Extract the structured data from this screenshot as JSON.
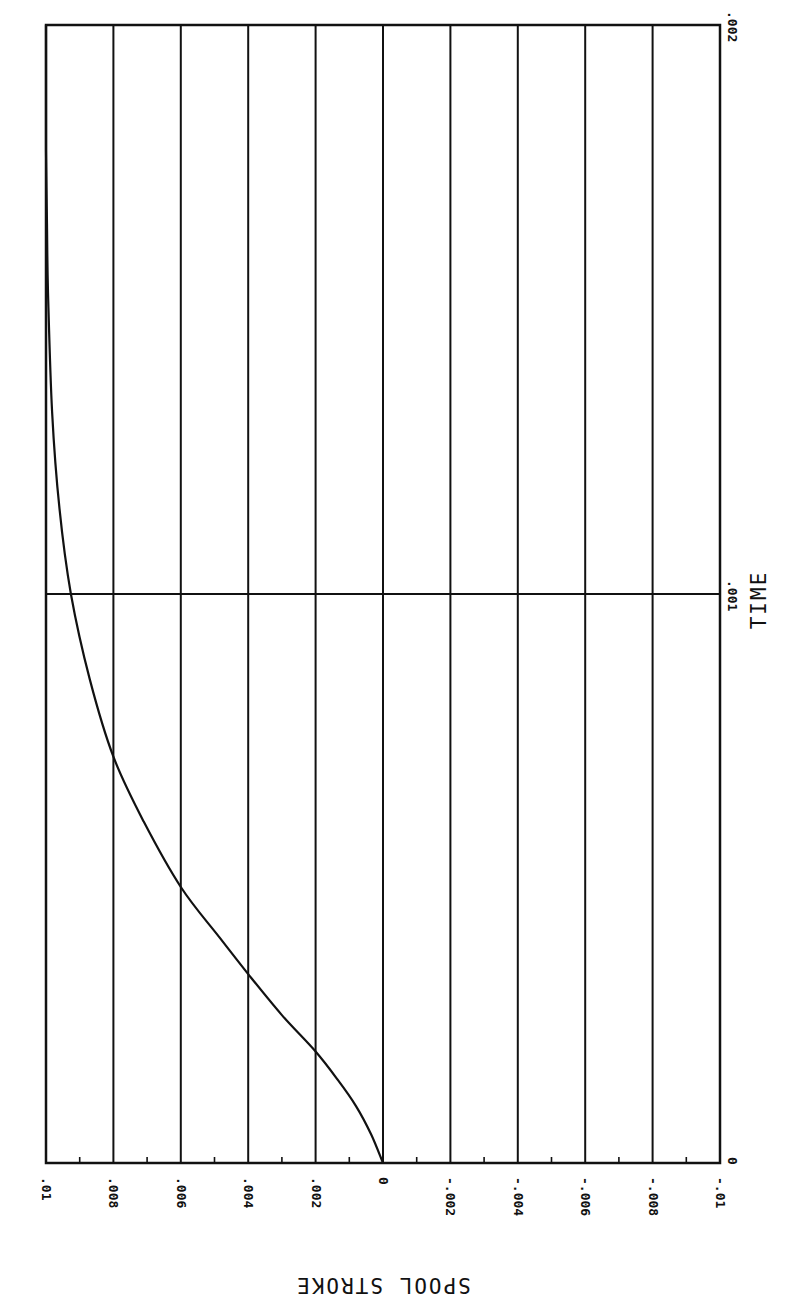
{
  "chart_data": {
    "type": "line",
    "title": "",
    "orientation": "rotated-90 (time runs bottom-to-top, stroke runs right-to-left)",
    "xlabel": "TIME",
    "ylabel": "SPOOL STROKE",
    "xlim": [
      0,
      0.002
    ],
    "ylim": [
      -0.01,
      0.01
    ],
    "x_ticks": [
      "0",
      ".001",
      ".002"
    ],
    "y_ticks": [
      ".01",
      ".008",
      ".006",
      ".004",
      ".002",
      "0",
      "-.002",
      "-.004",
      "-.006",
      "-.008",
      "-.01"
    ],
    "y_tick_values": [
      0.01,
      0.008,
      0.006,
      0.004,
      0.002,
      0,
      -0.002,
      -0.004,
      -0.006,
      -0.008,
      -0.01
    ],
    "x_tick_values": [
      0,
      0.001,
      0.002
    ],
    "grid": true,
    "legend": null,
    "series": [
      {
        "name": "SPOOL STROKE",
        "x": [
          0,
          5e-05,
          0.0001,
          0.000146,
          0.000196,
          0.00026,
          0.000332,
          0.0004,
          0.000485,
          0.0006,
          0.000714,
          0.00085,
          0.001,
          0.00115,
          0.00132,
          0.00153,
          0.00165,
          0.00178,
          0.0019,
          0.002
        ],
        "values": [
          0,
          0.00035,
          0.0008,
          0.00134,
          0.002,
          0.003,
          0.004,
          0.0049,
          0.006,
          0.0071,
          0.008,
          0.0087,
          0.00926,
          0.0096,
          0.00982,
          0.00994,
          0.00997,
          0.01,
          0.01,
          0.01
        ]
      }
    ]
  }
}
